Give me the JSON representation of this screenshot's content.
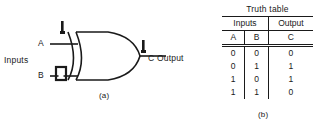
{
  "figure": {
    "caption_a": "(a)",
    "caption_b": "(b)"
  },
  "gate_diagram": {
    "gate_type": "XOR",
    "inputs_label": "Inputs",
    "input_a_label": "A",
    "input_b_label": "B",
    "output_label": "C  Output",
    "marks": {
      "arrow_a": "tick-mark",
      "arrow_b": "square-mark",
      "arrow_c": "tick-mark"
    },
    "line_color": "#1a1a1a"
  },
  "truth_table": {
    "title": "Truth table",
    "group_headers": [
      "Inputs",
      "Output"
    ],
    "columns": [
      "A",
      "B",
      "C"
    ],
    "rows": [
      [
        "0",
        "0",
        "0"
      ],
      [
        "0",
        "1",
        "1"
      ],
      [
        "1",
        "0",
        "1"
      ],
      [
        "1",
        "1",
        "0"
      ]
    ]
  }
}
